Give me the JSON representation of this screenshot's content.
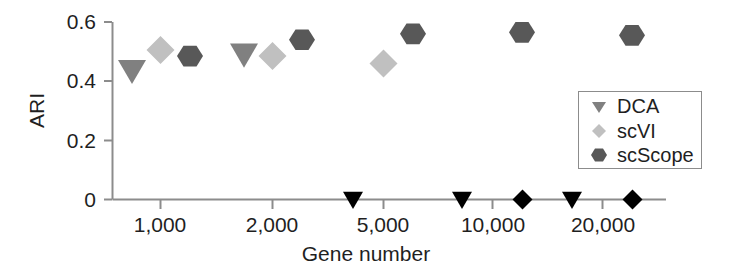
{
  "chart_data": {
    "type": "scatter",
    "title": "",
    "xlabel": "Gene number",
    "ylabel": "ARI",
    "categories": [
      "1,000",
      "2,000",
      "5,000",
      "10,000",
      "20,000"
    ],
    "xtick_labels": [
      "1,000",
      "2,000",
      "5,000",
      "10,000",
      "20,000"
    ],
    "ytick_labels": [
      "0",
      "0.2",
      "0.4",
      "0.6"
    ],
    "ytick_values": [
      0,
      0.2,
      0.4,
      0.6
    ],
    "ylim": [
      0,
      0.6
    ],
    "grid": false,
    "legend_position": "right",
    "note": "Zero values are plotted as solid black markers on the x-axis baseline (method failed / ARI = 0).",
    "series": [
      {
        "name": "DCA",
        "marker": "triangle-down",
        "color": "#808080",
        "zero_color": "#000000",
        "values": [
          0.435,
          0.49,
          0.0,
          0.0,
          0.0
        ]
      },
      {
        "name": "scVI",
        "marker": "diamond",
        "color": "#c0c0c0",
        "zero_color": "#000000",
        "values": [
          0.505,
          0.485,
          0.46,
          0.0,
          0.0
        ]
      },
      {
        "name": "scScope",
        "marker": "hexagon",
        "color": "#585858",
        "zero_color": "#000000",
        "values": [
          0.485,
          0.54,
          0.56,
          0.565,
          0.555
        ]
      }
    ]
  },
  "legend": {
    "entries": [
      {
        "label": "DCA"
      },
      {
        "label": "scVI"
      },
      {
        "label": "scScope"
      }
    ]
  },
  "axes": {
    "x_title": "Gene number",
    "y_title": "ARI"
  },
  "colors": {
    "dca": "#808080",
    "scvi": "#c0c0c0",
    "scscope": "#585858",
    "zero_marker": "#000000",
    "axis": "#8c8c8c",
    "text": "#1f1f1f",
    "background": "#ffffff"
  }
}
